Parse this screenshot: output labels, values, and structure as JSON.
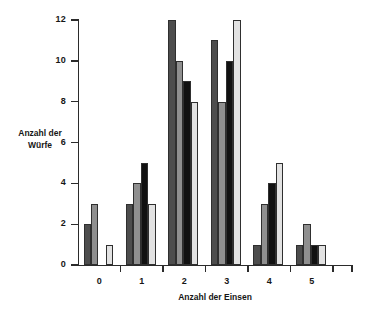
{
  "chart_data": {
    "type": "bar",
    "title": "",
    "subtitle": "",
    "xlabel": "Anzahl der Einsen",
    "ylabel_line1": "Anzahl der",
    "ylabel_line2": "Würfe",
    "categories": [
      "0",
      "1",
      "2",
      "3",
      "4",
      "5"
    ],
    "series": [
      {
        "name": "series-1",
        "color": "#4d4d4d",
        "values": [
          2,
          3,
          12,
          11,
          1,
          1
        ]
      },
      {
        "name": "series-2",
        "color": "#8f8f8f",
        "values": [
          3,
          4,
          10,
          8,
          3,
          2
        ]
      },
      {
        "name": "series-3",
        "color": "#111111",
        "values": [
          0,
          5,
          9,
          10,
          4,
          1
        ]
      },
      {
        "name": "series-4",
        "color": "#e2e2e2",
        "values": [
          1,
          3,
          8,
          12,
          5,
          1
        ]
      }
    ],
    "ylim": [
      0,
      12
    ],
    "yticks": [
      0,
      2,
      4,
      6,
      8,
      10,
      12
    ],
    "ytick_labels": [
      "0",
      "2",
      "4",
      "6",
      "8",
      "10",
      "12"
    ],
    "grid": false,
    "legend": "none",
    "bar_outline_color": "#2f2f2f",
    "axis_color": "#2b2b2b",
    "background": "#ffffff"
  }
}
